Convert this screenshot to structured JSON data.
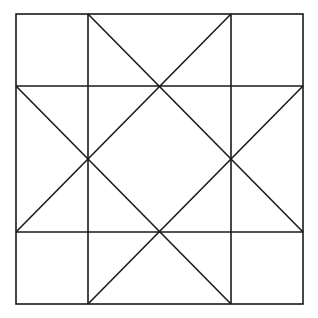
{
  "diagram": {
    "type": "geometric-quilt-pattern",
    "stroke_color": "#1a1a1a",
    "background_color": "#ffffff",
    "outer_square": {
      "x1": 16,
      "y1": 14,
      "x2": 303,
      "y2": 304
    },
    "grid_lines": {
      "vertical_x": [
        88,
        231
      ],
      "horizontal_y": [
        86,
        232
      ]
    },
    "diagonals": [
      {
        "name": "diag-top-left-to-right",
        "x1": 88,
        "y1": 14,
        "x2": 303,
        "y2": 232
      },
      {
        "name": "diag-top-right-to-left",
        "x1": 231,
        "y1": 14,
        "x2": 16,
        "y2": 232
      },
      {
        "name": "diag-left-to-bottom-right",
        "x1": 16,
        "y1": 86,
        "x2": 231,
        "y2": 304
      },
      {
        "name": "diag-right-to-bottom-left",
        "x1": 303,
        "y1": 86,
        "x2": 88,
        "y2": 304
      }
    ]
  }
}
